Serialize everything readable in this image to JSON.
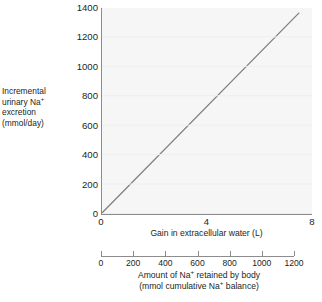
{
  "chart_data": {
    "type": "line",
    "title": "",
    "subtitle": "",
    "ylabel_lines": [
      "Incremental",
      "urinary Na+",
      "excretion",
      "(mmol/day)"
    ],
    "ylabel_plain": "Incremental urinary Na+ excretion (mmol/day)",
    "ylabel": "Incremental urinary Na+ excretion (mmol/day)",
    "yticks": [
      1400,
      1200,
      1000,
      800,
      600,
      400,
      200,
      0
    ],
    "ytick_labels": [
      "1400",
      "1200",
      "1000",
      "800",
      "600",
      "400",
      "200",
      "0"
    ],
    "ylim": [
      0,
      1400
    ],
    "grid": true,
    "legend": "none",
    "axes": [
      {
        "id": "primary-x",
        "xlabel": "Gain in extracellular water (L)",
        "xtick_labels": [
          "0",
          "4",
          "8"
        ],
        "xticks": [
          0,
          4,
          8
        ],
        "xlim": [
          0,
          8
        ],
        "unit": "L"
      },
      {
        "id": "secondary-x",
        "xlabel_lines": [
          "Amount of Na+ retained by body",
          "(mmol cumulative Na+ balance)"
        ],
        "xlabel": "Amount of Na+ retained by body (mmol cumulative Na+ balance)",
        "xtick_labels": [
          "0",
          "200",
          "400",
          "600",
          "800",
          "1000",
          "1200"
        ],
        "xticks": [
          0,
          200,
          400,
          600,
          800,
          1000,
          1200
        ],
        "xlim": [
          0,
          1200
        ],
        "unit": "mmol"
      }
    ],
    "x": [
      0,
      1,
      2,
      3,
      4,
      5,
      6,
      7,
      7.5
    ],
    "values": [
      0,
      182,
      364,
      546,
      728,
      910,
      1092,
      1274,
      1365
    ],
    "series": [
      {
        "name": "Incremental urinary Na+ excretion",
        "x": [
          0,
          7.5
        ],
        "values": [
          0,
          1365
        ],
        "color": "#808080",
        "linewidth": 1.3,
        "relationship": "linear"
      }
    ],
    "plot_background": "#f6f6f6",
    "axis_color": "#8c8c8c",
    "text_color": "#231f20"
  }
}
